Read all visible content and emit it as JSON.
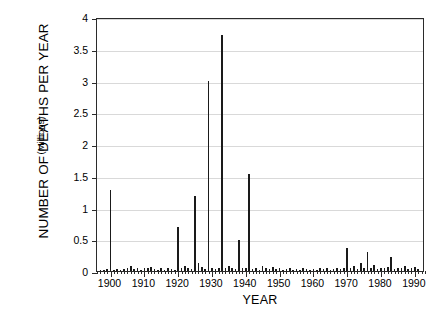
{
  "chart_data": {
    "type": "bar",
    "title": "",
    "xlabel": "YEAR",
    "ylabel": "NUMBER OF DEATHS PER YEAR",
    "ylabel_units": "(Millions)",
    "xlim": [
      1896,
      1993
    ],
    "ylim": [
      0,
      4
    ],
    "ytick_labels": [
      "0",
      "0.5",
      "1",
      "1.5",
      "2",
      "2.5",
      "3",
      "3.5",
      "4"
    ],
    "ytick_values": [
      0,
      0.5,
      1,
      1.5,
      2,
      2.5,
      3,
      3.5,
      4
    ],
    "xtick_labels": [
      "1900",
      "1910",
      "1920",
      "1930",
      "1940",
      "1950",
      "1960",
      "1970",
      "1980",
      "1990"
    ],
    "xtick_values": [
      1900,
      1910,
      1920,
      1930,
      1940,
      1950,
      1960,
      1970,
      1980,
      1990
    ],
    "xminor_step": 1,
    "grid": "horizontal",
    "legend": "none",
    "bar_color": "#1a1a1a",
    "x": [
      1897,
      1898,
      1899,
      1900,
      1901,
      1902,
      1903,
      1904,
      1905,
      1906,
      1907,
      1908,
      1909,
      1910,
      1911,
      1912,
      1913,
      1914,
      1915,
      1916,
      1917,
      1918,
      1919,
      1920,
      1921,
      1922,
      1923,
      1924,
      1925,
      1926,
      1927,
      1928,
      1929,
      1930,
      1931,
      1932,
      1933,
      1934,
      1935,
      1936,
      1937,
      1938,
      1939,
      1940,
      1941,
      1942,
      1943,
      1944,
      1945,
      1946,
      1947,
      1948,
      1949,
      1950,
      1951,
      1952,
      1953,
      1954,
      1955,
      1956,
      1957,
      1958,
      1959,
      1960,
      1961,
      1962,
      1963,
      1964,
      1965,
      1966,
      1967,
      1968,
      1969,
      1970,
      1971,
      1972,
      1973,
      1974,
      1975,
      1976,
      1977,
      1978,
      1979,
      1980,
      1981,
      1982,
      1983,
      1984,
      1985,
      1986,
      1987,
      1988,
      1989,
      1990,
      1991
    ],
    "values": [
      0.01,
      0.02,
      0.03,
      1.27,
      0.02,
      0.03,
      0.02,
      0.03,
      0.04,
      0.08,
      0.03,
      0.04,
      0.02,
      0.04,
      0.05,
      0.07,
      0.03,
      0.02,
      0.04,
      0.02,
      0.05,
      0.03,
      0.02,
      0.7,
      0.05,
      0.08,
      0.04,
      0.03,
      1.18,
      0.12,
      0.07,
      0.03,
      2.99,
      0.05,
      0.03,
      0.04,
      3.72,
      0.04,
      0.08,
      0.05,
      0.03,
      0.49,
      0.05,
      0.04,
      1.52,
      0.03,
      0.05,
      0.02,
      0.08,
      0.04,
      0.03,
      0.06,
      0.03,
      0.04,
      0.02,
      0.03,
      0.05,
      0.02,
      0.03,
      0.02,
      0.04,
      0.03,
      0.02,
      0.03,
      0.02,
      0.04,
      0.03,
      0.05,
      0.02,
      0.03,
      0.04,
      0.03,
      0.05,
      0.37,
      0.04,
      0.08,
      0.03,
      0.12,
      0.05,
      0.3,
      0.04,
      0.09,
      0.03,
      0.05,
      0.04,
      0.07,
      0.22,
      0.03,
      0.05,
      0.04,
      0.08,
      0.03,
      0.05,
      0.06,
      0.03
    ]
  }
}
